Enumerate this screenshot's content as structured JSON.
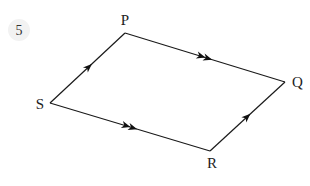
{
  "question": {
    "number": "5"
  },
  "diagram": {
    "type": "parallelogram-vectors",
    "vertices": [
      {
        "id": "P",
        "label": "P"
      },
      {
        "id": "Q",
        "label": "Q"
      },
      {
        "id": "R",
        "label": "R"
      },
      {
        "id": "S",
        "label": "S"
      }
    ],
    "edges": [
      {
        "from": "S",
        "to": "P",
        "arrows": 1
      },
      {
        "from": "P",
        "to": "Q",
        "arrows": 2
      },
      {
        "from": "S",
        "to": "R",
        "arrows": 2
      },
      {
        "from": "R",
        "to": "Q",
        "arrows": 1
      }
    ],
    "colors": {
      "line": "#1a1a1a",
      "label": "#222222",
      "badge": "#f2f2f2"
    }
  }
}
